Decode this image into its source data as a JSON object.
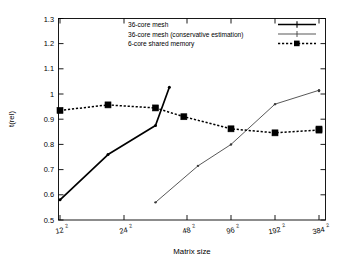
{
  "chart_data": {
    "type": "line",
    "title": "",
    "xlabel": "Matrix size",
    "ylabel": "t(rel)",
    "categories": [
      "12²",
      "24²",
      "48²",
      "96²",
      "192²",
      "384²"
    ],
    "category_labels_base": [
      "12",
      "24",
      "48",
      "96",
      "192",
      "384"
    ],
    "category_labels_exp": [
      "2",
      "2",
      "2",
      "2",
      "2",
      "2"
    ],
    "xlim": [
      0,
      6.5
    ],
    "ylim": [
      0.5,
      1.3
    ],
    "ytick_labels": [
      "0.5",
      "0.6",
      "0.7",
      "0.8",
      "0.9",
      "1",
      "1.1",
      "1.2",
      "1.3"
    ],
    "ytick_values": [
      0.5,
      0.6,
      0.7,
      0.8,
      0.9,
      1.0,
      1.1,
      1.2,
      1.3
    ],
    "grid": false,
    "legend_position": "top-center",
    "series": [
      {
        "name": "36-core mesh",
        "color": "#000000",
        "style": "solid-bold",
        "marker": "plus",
        "x": [
          0.0,
          0.75,
          1.5,
          1.72
        ],
        "values": [
          0.58,
          0.76,
          0.875,
          1.027
        ]
      },
      {
        "name": "36-core mesh (conservative estimation)",
        "color": "#3a3a3a",
        "style": "solid-thin",
        "marker": "plus",
        "x": [
          1.5,
          2.25,
          3.0,
          4.0,
          5.0,
          6.0
        ],
        "values": [
          0.57,
          0.715,
          0.8,
          0.96,
          1.015,
          1.012
        ]
      },
      {
        "name": "6-core shared memory",
        "color": "#000000",
        "style": "dotted",
        "marker": "square",
        "x": [
          0.0,
          0.75,
          1.5,
          1.95,
          3.0,
          4.0,
          5.0,
          6.0
        ],
        "values": [
          0.935,
          0.957,
          0.945,
          0.91,
          0.862,
          0.846,
          0.857,
          0.861
        ]
      }
    ]
  },
  "legend": {
    "entries": [
      {
        "label": "36-core mesh"
      },
      {
        "label": "36-core mesh (conservative estimation)"
      },
      {
        "label": "6-core shared memory"
      }
    ]
  },
  "axes": {
    "x_title": "Matrix size",
    "y_title": "t(rel)"
  }
}
